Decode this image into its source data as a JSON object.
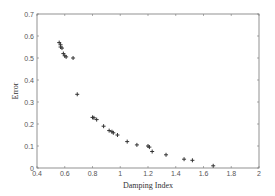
{
  "chart_data": {
    "type": "scatter",
    "title": "",
    "xlabel": "Damping Index",
    "ylabel": "Error",
    "xlim": [
      0.4,
      2
    ],
    "ylim": [
      0,
      0.7
    ],
    "xticks": [
      "0.4",
      "0.6",
      "0.8",
      "1",
      "1.2",
      "1.4",
      "1.6",
      "1.8",
      "2"
    ],
    "yticks": [
      "0",
      "0.1",
      "0.2",
      "0.3",
      "0.4",
      "0.5",
      "0.6",
      "0.7"
    ],
    "grid": false,
    "legend": null,
    "marker": "+",
    "marker_color": "#333333",
    "series": [
      {
        "name": "Error vs Damping Index",
        "x": [
          0.56,
          0.57,
          0.57,
          0.58,
          0.59,
          0.6,
          0.61,
          0.66,
          0.69,
          0.8,
          0.81,
          0.83,
          0.88,
          0.92,
          0.94,
          0.95,
          0.98,
          1.05,
          1.12,
          1.2,
          1.21,
          1.23,
          1.33,
          1.46,
          1.52,
          1.67
        ],
        "y": [
          0.57,
          0.56,
          0.55,
          0.545,
          0.52,
          0.51,
          0.505,
          0.5,
          0.335,
          0.23,
          0.228,
          0.22,
          0.19,
          0.17,
          0.165,
          0.16,
          0.15,
          0.12,
          0.105,
          0.1,
          0.095,
          0.075,
          0.06,
          0.04,
          0.035,
          0.01
        ]
      }
    ]
  }
}
